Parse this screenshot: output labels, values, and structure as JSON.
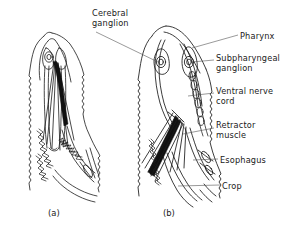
{
  "figure": {
    "background_color": "#ffffff",
    "line_color": "#1a1a1a",
    "fill_color_muscle": "#000000"
  },
  "panels": [
    {
      "id": "a",
      "label": "(a)"
    },
    {
      "id": "b",
      "label": "(b)"
    }
  ],
  "labels": {
    "cerebral_ganglion": "Cerebral\nganglion",
    "pharynx": "Pharynx",
    "subpharyngeal_ganglion": "Subpharyngeal\nganglion",
    "ventral_nerve_cord": "Ventral nerve\ncord",
    "retractor_muscle": "Retractor\nmuscle",
    "esophagus": "Esophagus",
    "crop": "Crop"
  },
  "callouts": [
    {
      "name": "cerebral-ganglion",
      "text": "Cerebral\nganglion",
      "x": 92,
      "y": 8
    },
    {
      "name": "pharynx",
      "text": "Pharynx",
      "x": 240,
      "y": 31
    },
    {
      "name": "subpharyngeal-ganglion",
      "text": "Subpharyngeal\nganglion",
      "x": 216,
      "y": 53
    },
    {
      "name": "ventral-nerve-cord",
      "text": "Ventral nerve\ncord",
      "x": 216,
      "y": 86
    },
    {
      "name": "retractor-muscle",
      "text": "Retractor\nmuscle",
      "x": 216,
      "y": 120
    },
    {
      "name": "esophagus",
      "text": "Esophagus",
      "x": 220,
      "y": 155
    },
    {
      "name": "crop",
      "text": "Crop",
      "x": 222,
      "y": 181
    }
  ]
}
